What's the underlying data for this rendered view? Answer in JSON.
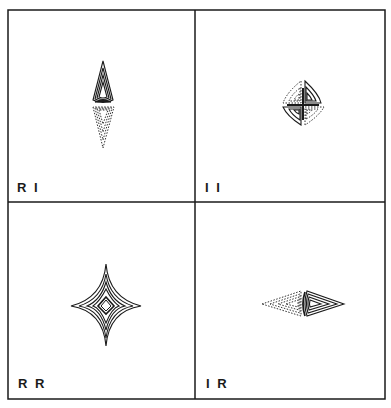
{
  "figure": {
    "layout": "2x2 grid",
    "panels": [
      {
        "id": "RI",
        "label": "R I",
        "position": "top-left",
        "shape": "vertical diamond: solid nested triangles pointing up, dashed nested triangles pointing down"
      },
      {
        "id": "II",
        "label": "I I",
        "position": "top-right",
        "shape": "four-lobed pinwheel: solid lobes top-right and bottom-left, dashed lobes top-left and bottom-right"
      },
      {
        "id": "RR",
        "label": "R R",
        "position": "bottom-left",
        "shape": "four-pointed star of solid nested contours with a small central diamond"
      },
      {
        "id": "IR",
        "label": "I R",
        "position": "bottom-right",
        "shape": "horizontal diamond: dashed nested triangles pointing left, solid nested triangles pointing right"
      }
    ]
  },
  "colors": {
    "ink": "#1a1a1a",
    "background": "#ffffff"
  }
}
